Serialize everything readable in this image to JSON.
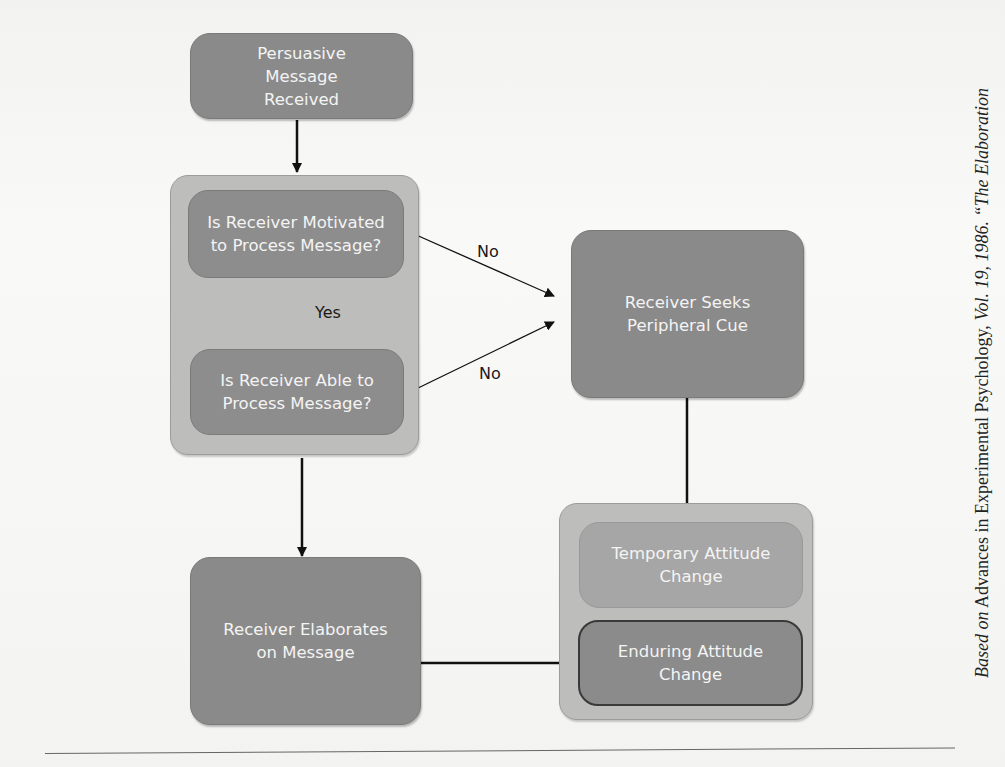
{
  "diagram": {
    "nodes": {
      "message_received": "Persuasive Message Received",
      "motivated": "Is Receiver Motivated to Process Message?",
      "able": "Is Receiver Able to Process Message?",
      "peripheral": "Receiver Seeks Peripheral Cue",
      "elaborates": "Receiver Elaborates on Message",
      "temporary": "Temporary Attitude Change",
      "enduring": "Enduring Attitude Change"
    },
    "edge_labels": {
      "yes": "Yes",
      "no_motivated": "No",
      "no_able": "No"
    },
    "colors": {
      "node_fill": "#8a8a8a",
      "group_fill": "#bdbdbc",
      "temporary_fill": "#a6a6a6",
      "enduring_border": "#3a3a3a",
      "arrow": "#111111"
    }
  },
  "caption": {
    "based_on": "Based on",
    "source": "Advances in Experimental Psychology,",
    "volume": "Vol. 19, 1986.",
    "title_start": "“The Elaboration"
  }
}
